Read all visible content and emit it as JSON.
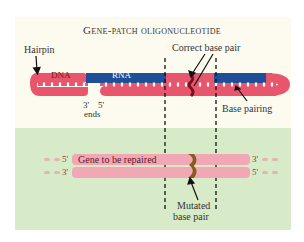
{
  "title": "Gene-patch oligonucleotide",
  "top_panel": {
    "labels": {
      "hairpin": "Hairpin",
      "dna": "DNA",
      "rna": "RNA",
      "correct_base_pair": "Correct base pair",
      "base_pairing": "Base pairing",
      "end_3": "3'",
      "end_5": "5'",
      "ends": "ends"
    }
  },
  "bottom_panel": {
    "labels": {
      "gene": "Gene to be repaired",
      "left_top": "5'",
      "left_bottom": "3'",
      "right_top": "3'",
      "right_bottom": "5'",
      "mutated_line1": "Mutated",
      "mutated_line2": "base pair"
    }
  },
  "colors": {
    "dna_pink": "#e8566e",
    "rna_blue": "#1f4f99",
    "light_pink": "#f2a7b4",
    "bottom_bg": "#d8ebc9",
    "top_bg": "#fdfbf0",
    "mutated_brown": "#8a5a1c",
    "correct_dark": "#7a1020"
  }
}
